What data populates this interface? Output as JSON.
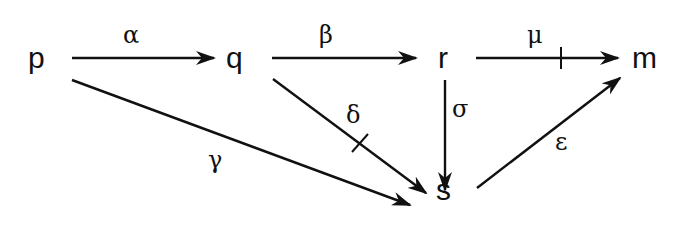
{
  "diagram": {
    "type": "commutative-diagram",
    "nodes": [
      {
        "id": "p",
        "label": "p",
        "x": 40,
        "y": 58
      },
      {
        "id": "q",
        "label": "q",
        "x": 237,
        "y": 58
      },
      {
        "id": "r",
        "label": "r",
        "x": 444,
        "y": 58
      },
      {
        "id": "m",
        "label": "m",
        "x": 648,
        "y": 58
      },
      {
        "id": "s",
        "label": "s",
        "x": 445,
        "y": 195
      }
    ],
    "edges": [
      {
        "from": "p",
        "to": "q",
        "label": "α",
        "crossed": false
      },
      {
        "from": "q",
        "to": "r",
        "label": "β",
        "crossed": false
      },
      {
        "from": "r",
        "to": "m",
        "label": "μ",
        "crossed": true
      },
      {
        "from": "p",
        "to": "s",
        "label": "γ",
        "crossed": false
      },
      {
        "from": "q",
        "to": "s",
        "label": "δ",
        "crossed": true
      },
      {
        "from": "r",
        "to": "s",
        "label": "σ",
        "crossed": false
      },
      {
        "from": "s",
        "to": "m",
        "label": "ε",
        "crossed": false
      }
    ]
  }
}
